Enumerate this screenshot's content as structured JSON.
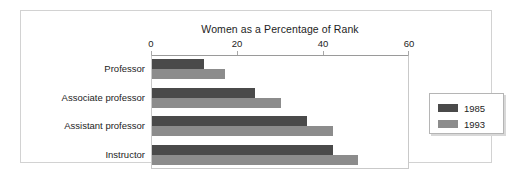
{
  "chart_data": {
    "type": "bar",
    "orientation": "horizontal",
    "title": "Women as a Percentage of Rank",
    "xlabel": "",
    "ylabel": "",
    "xlim": [
      0,
      60
    ],
    "xticks": [
      0,
      20,
      40,
      60
    ],
    "xtick_labels": [
      "0",
      "20",
      "40",
      "60"
    ],
    "grid": false,
    "legend_position": "right",
    "categories": [
      "Professor",
      "Associate professor",
      "Assistant professor",
      "Instructor"
    ],
    "series": [
      {
        "name": "1985",
        "color": "#4a4a4a",
        "values": [
          12,
          24,
          36,
          42
        ]
      },
      {
        "name": "1993",
        "color": "#8c8c8c",
        "values": [
          17,
          30,
          42,
          48
        ]
      }
    ]
  },
  "frame": {
    "border_color": "#d2d2d2",
    "background": "#ffffff"
  }
}
